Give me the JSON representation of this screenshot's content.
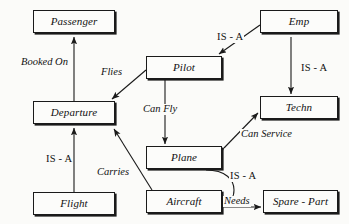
{
  "diagram": {
    "background_color": "#fbfbf9",
    "line_color": "#1a1a1a",
    "text_color": "#111111",
    "entities": [
      {
        "id": "passenger",
        "label": "Passenger",
        "x": 33,
        "y": 10,
        "w": 82,
        "h": 23
      },
      {
        "id": "departure",
        "label": "Departure",
        "x": 33,
        "y": 101,
        "w": 82,
        "h": 23
      },
      {
        "id": "flight",
        "label": "Flight",
        "x": 33,
        "y": 192,
        "w": 82,
        "h": 23
      },
      {
        "id": "pilot",
        "label": "Pilot",
        "x": 146,
        "y": 56,
        "w": 76,
        "h": 23
      },
      {
        "id": "plane",
        "label": "Plane",
        "x": 146,
        "y": 146,
        "w": 76,
        "h": 23
      },
      {
        "id": "aircraft",
        "label": "Aircraft",
        "x": 146,
        "y": 190,
        "w": 76,
        "h": 23
      },
      {
        "id": "emp",
        "label": "Emp",
        "x": 260,
        "y": 10,
        "w": 78,
        "h": 23
      },
      {
        "id": "techn",
        "label": "Techn",
        "x": 260,
        "y": 96,
        "w": 78,
        "h": 23
      },
      {
        "id": "spare_part",
        "label": "Spare - Part",
        "x": 263,
        "y": 190,
        "w": 75,
        "h": 23
      }
    ],
    "relationships": [
      {
        "id": "booked-on",
        "label": "Booked On",
        "style": "italic",
        "from": "departure",
        "to": "passenger",
        "label_x": 20,
        "label_y": 57
      },
      {
        "id": "flies",
        "label": "Flies",
        "style": "italic",
        "from": "pilot",
        "to": "departure",
        "label_x": 100,
        "label_y": 67
      },
      {
        "id": "is-a-flight",
        "label": "IS - A",
        "style": "roman",
        "from": "flight",
        "to": "departure",
        "label_x": 45,
        "label_y": 154
      },
      {
        "id": "carries",
        "label": "Carries",
        "style": "italic",
        "from": "aircraft",
        "to": "departure",
        "label_x": 96,
        "label_y": 167
      },
      {
        "id": "can-fly",
        "label": "Can Fly",
        "style": "italic",
        "from": "pilot",
        "to": "plane",
        "label_x": 142,
        "label_y": 104
      },
      {
        "id": "can-service",
        "label": "Can Service",
        "style": "italic",
        "from": "plane",
        "to": "techn",
        "label_x": 240,
        "label_y": 129
      },
      {
        "id": "is-a-pilot",
        "label": "IS - A",
        "style": "roman",
        "from": "emp",
        "to": "pilot",
        "label_x": 216,
        "label_y": 32
      },
      {
        "id": "is-a-techn",
        "label": "IS - A",
        "style": "roman",
        "from": "emp",
        "to": "techn",
        "label_x": 300,
        "label_y": 63
      },
      {
        "id": "is-a-plane",
        "label": "IS - A",
        "style": "roman",
        "from": "plane",
        "to": "aircraft",
        "label_x": 229,
        "label_y": 171
      },
      {
        "id": "needs",
        "label": "Needs",
        "style": "italic",
        "from": "aircraft",
        "to": "spare_part",
        "label_x": 223,
        "label_y": 196
      }
    ]
  }
}
